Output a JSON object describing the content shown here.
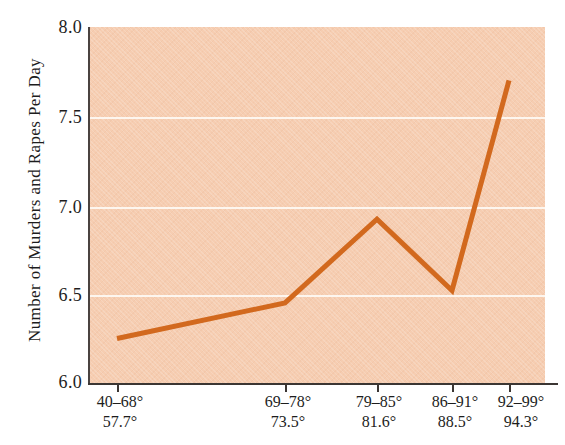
{
  "chart_data": {
    "type": "line",
    "title": "",
    "xlabel": "",
    "ylabel": "Number of Murders and Rapes Per Day",
    "categories": [
      "40–68°",
      "69–78°",
      "79–85°",
      "86–91°",
      "92–99°"
    ],
    "category_means": [
      "57.7°",
      "73.5°",
      "81.6°",
      "88.5°",
      "94.3°"
    ],
    "values": [
      6.25,
      6.45,
      6.92,
      6.52,
      7.7
    ],
    "ylim": [
      6.0,
      8.0
    ],
    "yticks": [
      "8.0",
      "7.5",
      "7.0",
      "6.5",
      "6.0"
    ],
    "ytick_values": [
      8.0,
      7.5,
      7.0,
      6.5,
      6.0
    ],
    "grid": true,
    "legend": "none",
    "series_color": "#d2691e",
    "plot_background": "#f6cdb1",
    "gridline_color": "#fdf6ef",
    "axis_color": "#3b3633"
  }
}
